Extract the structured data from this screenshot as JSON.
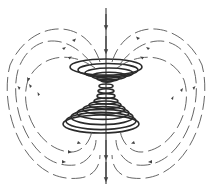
{
  "figure": {
    "colors": {
      "background": "#ffffff",
      "field_lines": "#555555",
      "coil_rings": "#2a2a2a",
      "axis": "#3a3a3a"
    },
    "elements": {
      "axis_arrows": "downward",
      "upper_rings": 6,
      "lower_rings": 7,
      "field_loops_per_side": 3
    }
  }
}
